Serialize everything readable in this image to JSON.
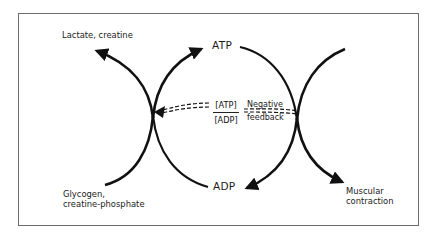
{
  "diagram": {
    "labels": {
      "lactate_creatine": "Lactate, creatine",
      "atp": "ATP",
      "adp": "ADP",
      "glycogen_line1": "Glycogen,",
      "glycogen_line2": "creatine-phosphate",
      "muscular_line1": "Muscular",
      "muscular_line2": "contraction",
      "ratio_numerator": "[ATP]",
      "ratio_denominator": "[ADP]",
      "feedback_line1": "Negative",
      "feedback_line2": "feedback"
    },
    "colors": {
      "stroke": "#111111",
      "frame": "#6b6b6b",
      "background": "#ffffff"
    },
    "nodes": [
      {
        "id": "left-junction",
        "x": 153,
        "y": 118
      },
      {
        "id": "right-junction",
        "x": 297,
        "y": 118
      }
    ],
    "edges": [
      {
        "from": "left-junction",
        "to": "Lactate, creatine",
        "arrow": true
      },
      {
        "from": "left-junction",
        "to": "ATP",
        "arrow": true
      },
      {
        "from": "Glycogen, creatine-phosphate",
        "to": "left-junction",
        "arrow": false
      },
      {
        "from": "ADP",
        "to": "left-junction",
        "arrow": false
      },
      {
        "from": "ATP",
        "to": "right-junction",
        "arrow": false
      },
      {
        "from": "right-junction",
        "to": "ADP",
        "arrow": true
      },
      {
        "from": "right-junction",
        "to": "Muscular contraction",
        "arrow": true
      },
      {
        "from": "right-junction",
        "to": "left-junction",
        "style": "dashed-double",
        "label": "Negative feedback",
        "arrow": true
      }
    ]
  }
}
